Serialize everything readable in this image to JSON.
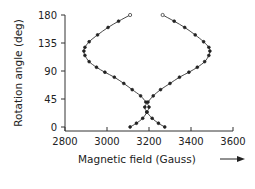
{
  "chart_data": {
    "type": "line",
    "title": "",
    "xlabel": "Magnetic field (Gauss)",
    "ylabel": "Rotation angle (deg)",
    "xlim": [
      2800,
      3600
    ],
    "ylim": [
      0,
      180
    ],
    "x_ticks": [
      "2800",
      "3000",
      "3200",
      "3400",
      "3600"
    ],
    "y_ticks": [
      "0",
      "45",
      "90",
      "135",
      "180"
    ],
    "grid": false,
    "legend": null,
    "annotations": [
      "arrow pointing right after x-axis label"
    ],
    "series": [
      {
        "name": "branch-1",
        "marker": "dot",
        "points": [
          [
            3110,
            180
          ],
          [
            3055,
            170
          ],
          [
            3005,
            160
          ],
          [
            2955,
            148
          ],
          [
            2915,
            137
          ],
          [
            2895,
            128
          ],
          [
            2890,
            122
          ],
          [
            2895,
            115
          ],
          [
            2915,
            105
          ],
          [
            2950,
            96
          ],
          [
            2990,
            88
          ],
          [
            3035,
            80
          ],
          [
            3080,
            70
          ],
          [
            3120,
            60
          ],
          [
            3160,
            50
          ],
          [
            3185,
            40
          ],
          [
            3200,
            32
          ],
          [
            3190,
            24
          ],
          [
            3170,
            14
          ],
          [
            3140,
            6
          ],
          [
            3110,
            0
          ]
        ]
      },
      {
        "name": "branch-2",
        "marker": "dot",
        "points": [
          [
            3265,
            180
          ],
          [
            3320,
            170
          ],
          [
            3370,
            160
          ],
          [
            3420,
            148
          ],
          [
            3460,
            137
          ],
          [
            3485,
            128
          ],
          [
            3490,
            122
          ],
          [
            3485,
            115
          ],
          [
            3465,
            105
          ],
          [
            3430,
            96
          ],
          [
            3390,
            88
          ],
          [
            3345,
            80
          ],
          [
            3300,
            70
          ],
          [
            3255,
            60
          ],
          [
            3220,
            50
          ],
          [
            3195,
            40
          ],
          [
            3180,
            32
          ],
          [
            3190,
            24
          ],
          [
            3215,
            14
          ],
          [
            3245,
            6
          ],
          [
            3275,
            0
          ]
        ]
      }
    ]
  },
  "labels": {
    "xlabel": "Magnetic field (Gauss)",
    "ylabel": "Rotation angle (deg)",
    "x_ticks": [
      "2800",
      "3000",
      "3200",
      "3400",
      "3600"
    ],
    "y_ticks": [
      "0",
      "45",
      "90",
      "135",
      "180"
    ]
  }
}
